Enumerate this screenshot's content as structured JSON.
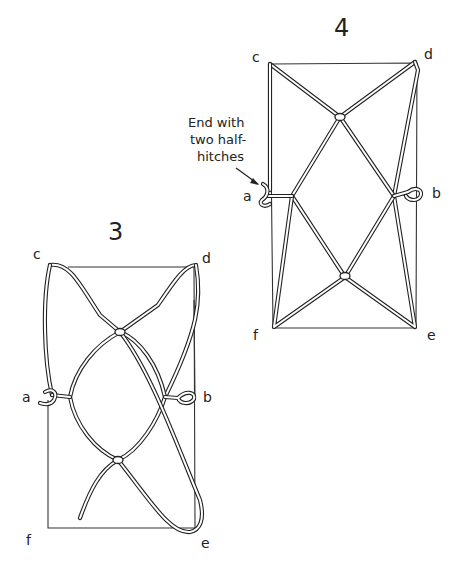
{
  "figures": [
    {
      "id": "3",
      "label": "3",
      "points": {
        "c": "c",
        "d": "d",
        "a": "a",
        "b": "b",
        "f": "f",
        "e": "e"
      }
    },
    {
      "id": "4",
      "label": "4",
      "points": {
        "c": "c",
        "d": "d",
        "a": "a",
        "b": "b",
        "f": "f",
        "e": "e"
      },
      "annotation": {
        "lines": [
          "End with",
          "two half-",
          "hitches"
        ]
      }
    }
  ],
  "colors": {
    "ink": "#222222",
    "background": "#ffffff"
  }
}
